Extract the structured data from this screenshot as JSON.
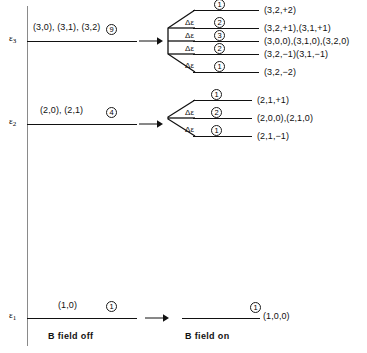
{
  "figure": {
    "type": "energy-level-splitting-diagram",
    "caption_left": "B field off",
    "caption_right": "B field on",
    "delta_label": "Δε"
  },
  "axis": {
    "levels": [
      {
        "name": "epsilon-3",
        "symbol": "ε",
        "subscript": "3"
      },
      {
        "name": "epsilon-2",
        "symbol": "ε",
        "subscript": "2"
      },
      {
        "name": "epsilon-1",
        "symbol": "ε",
        "subscript": "1"
      }
    ]
  },
  "levels": [
    {
      "id": "eps3",
      "unsplit_label": "(3,0), (3,1), (3,2)",
      "unsplit_degeneracy": "9",
      "split": [
        {
          "degeneracy": "1",
          "states": "(3,2,+2)",
          "delta": ""
        },
        {
          "degeneracy": "2",
          "states": "(3,2,+1),(3,1,+1)",
          "delta": "Δε"
        },
        {
          "degeneracy": "3",
          "states": "(3,0,0),(3,1,0),(3,2,0)",
          "delta": "Δε"
        },
        {
          "degeneracy": "2",
          "states": "(3,2,−1)(3,1,−1)",
          "delta": "Δε"
        },
        {
          "degeneracy": "1",
          "states": "(3,2,−2)",
          "delta": "Δε"
        }
      ]
    },
    {
      "id": "eps2",
      "unsplit_label": "(2,0), (2,1)",
      "unsplit_degeneracy": "4",
      "split": [
        {
          "degeneracy": "1",
          "states": "(2,1,+1)",
          "delta": ""
        },
        {
          "degeneracy": "2",
          "states": "(2,0,0),(2,1,0)",
          "delta": "Δε"
        },
        {
          "degeneracy": "1",
          "states": "(2,1,−1)",
          "delta": "Δε"
        }
      ]
    },
    {
      "id": "eps1",
      "unsplit_label": "(1,0)",
      "unsplit_degeneracy": "1",
      "split": [
        {
          "degeneracy": "1",
          "states": "(1,0,0)",
          "delta": ""
        }
      ]
    }
  ],
  "colors": {
    "ink": "#111111",
    "axis": "#8a8a8a",
    "background": "#ffffff"
  }
}
